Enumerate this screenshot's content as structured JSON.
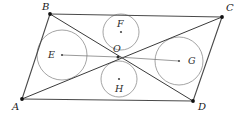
{
  "figure": {
    "kind": "geometry-diagram",
    "background_color": "#ffffff",
    "line_color": "#3a3a3a",
    "circle_color": "#8d8d8d",
    "point_color": "#111111",
    "label_color": "#1a1a1a",
    "width": 241,
    "height": 118
  },
  "vertices": [
    {
      "id": "A",
      "label": "A",
      "x": 22,
      "y": 99,
      "label_x": 12,
      "label_y": 104
    },
    {
      "id": "B",
      "label": "B",
      "x": 50,
      "y": 14,
      "label_x": 42,
      "label_y": 3
    },
    {
      "id": "C",
      "label": "C",
      "x": 222,
      "y": 17,
      "label_x": 226,
      "label_y": 4
    },
    {
      "id": "D",
      "label": "D",
      "x": 193,
      "y": 101,
      "label_x": 198,
      "label_y": 104
    }
  ],
  "center_point": {
    "id": "O",
    "label": "O",
    "x": 118,
    "y": 57,
    "label_x": 113,
    "label_y": 45
  },
  "edges": [
    {
      "id": "AB",
      "from": "A",
      "to": "B",
      "x1": 22,
      "y1": 99,
      "x2": 50,
      "y2": 14
    },
    {
      "id": "BC",
      "from": "B",
      "to": "C",
      "x1": 50,
      "y1": 14,
      "x2": 222,
      "y2": 17
    },
    {
      "id": "CD",
      "from": "C",
      "to": "D",
      "x1": 222,
      "y1": 17,
      "x2": 193,
      "y2": 101
    },
    {
      "id": "DA",
      "from": "D",
      "to": "A",
      "x1": 193,
      "y1": 101,
      "x2": 22,
      "y2": 99
    }
  ],
  "diagonals": [
    {
      "id": "AC",
      "from": "A",
      "to": "C",
      "x1": 22,
      "y1": 99,
      "x2": 222,
      "y2": 17
    },
    {
      "id": "BD",
      "from": "B",
      "to": "D",
      "x1": 50,
      "y1": 14,
      "x2": 193,
      "y2": 101
    }
  ],
  "circles": [
    {
      "id": "E",
      "label": "E",
      "cx": 62,
      "cy": 55,
      "r": 25,
      "label_x": 48,
      "label_y": 50
    },
    {
      "id": "F",
      "label": "F",
      "cx": 121,
      "cy": 32,
      "r": 18,
      "label_x": 116,
      "label_y": 20
    },
    {
      "id": "G",
      "label": "G",
      "cx": 179,
      "cy": 61,
      "r": 24,
      "label_x": 188,
      "label_y": 56
    },
    {
      "id": "H",
      "label": "H",
      "cx": 119,
      "cy": 79,
      "r": 18,
      "label_x": 114,
      "label_y": 83
    }
  ],
  "center_spokes": [
    {
      "id": "E-to-O-upper",
      "x1": 62,
      "y1": 55,
      "x2": 118,
      "y2": 57
    },
    {
      "id": "G-to-O-upper",
      "x1": 179,
      "y1": 61,
      "x2": 118,
      "y2": 57
    }
  ]
}
